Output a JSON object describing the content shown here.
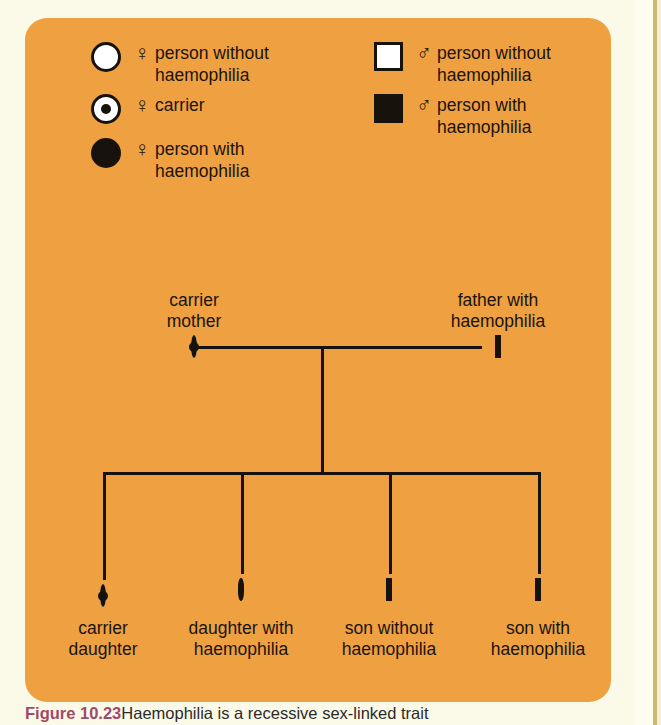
{
  "figure": {
    "panel_color": "#EFA040",
    "ink_color": "#17120c",
    "page_background": "#FBF9E8"
  },
  "legend": {
    "left_column": [
      {
        "symbol": "circle-open",
        "sex_glyph": "♀",
        "sex_name": "female-symbol",
        "label": "person without\nhaemophilia"
      },
      {
        "symbol": "circle-carrier",
        "sex_glyph": "♀",
        "sex_name": "female-symbol",
        "label": "carrier"
      },
      {
        "symbol": "circle-filled",
        "sex_glyph": "♀",
        "sex_name": "female-symbol",
        "label": "person with\nhaemophilia"
      }
    ],
    "right_column": [
      {
        "symbol": "square-open",
        "sex_glyph": "♂",
        "sex_name": "male-symbol",
        "label": "person without\nhaemophilia"
      },
      {
        "symbol": "square-filled",
        "sex_glyph": "♂",
        "sex_name": "male-symbol",
        "label": "person with\nhaemophilia"
      }
    ]
  },
  "pedigree": {
    "parents": [
      {
        "id": "mother",
        "symbol": "circle-carrier",
        "label": "carrier\nmother",
        "label_position": "above"
      },
      {
        "id": "father",
        "symbol": "square-filled",
        "label": "father with\nhaemophilia",
        "label_position": "above"
      }
    ],
    "children": [
      {
        "id": "child-1",
        "symbol": "circle-carrier",
        "label": "carrier\ndaughter",
        "label_position": "below"
      },
      {
        "id": "child-2",
        "symbol": "circle-filled",
        "label": "daughter with\nhaemophilia",
        "label_position": "below"
      },
      {
        "id": "child-3",
        "symbol": "square-open",
        "label": "son without\nhaemophilia",
        "label_position": "below"
      },
      {
        "id": "child-4",
        "symbol": "square-filled",
        "label": "son with\nhaemophilia",
        "label_position": "below"
      }
    ]
  },
  "caption": {
    "figure_number": "Figure 10.23",
    "text": "Haemophilia is a recessive sex-linked trait"
  }
}
